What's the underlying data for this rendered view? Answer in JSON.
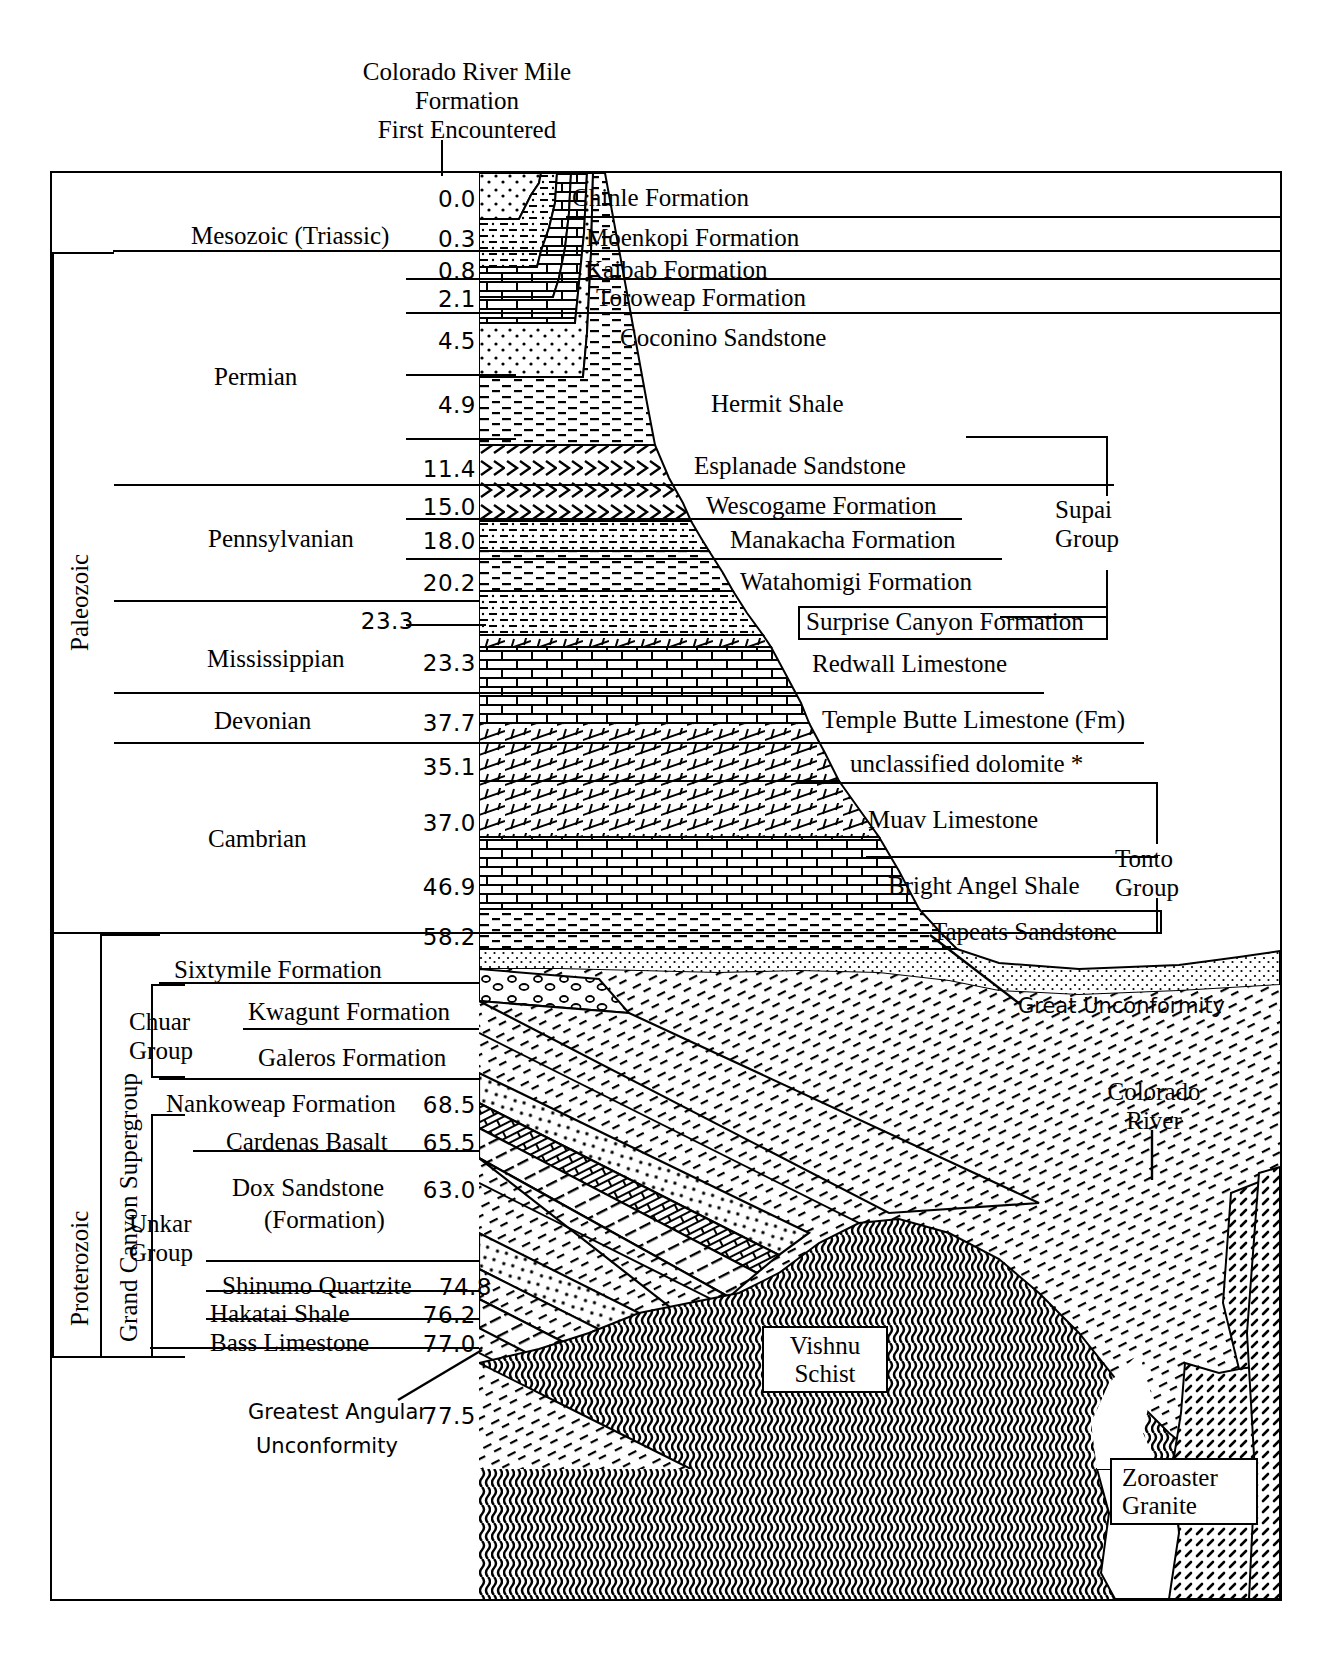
{
  "title": {
    "line1": "Colorado River Mile",
    "line2": "Formation",
    "line3": "First Encountered"
  },
  "eras": [
    {
      "name": "Mesozoic",
      "qualifier": "(Triassic)"
    },
    {
      "name": "Paleozoic",
      "qualifier": ""
    },
    {
      "name": "Proterozoic",
      "qualifier": ""
    }
  ],
  "periods": [
    {
      "label": "Mesozoic   (Triassic)"
    },
    {
      "label": "Permian"
    },
    {
      "label": "Pennsylvanian"
    },
    {
      "label": "Mississippian"
    },
    {
      "label": "Devonian"
    },
    {
      "label": "Cambrian"
    }
  ],
  "era_vertical_labels": [
    {
      "label": "Paleozoic"
    },
    {
      "label": "Proterozoic"
    },
    {
      "label": "Grand Canyon Supergroup"
    }
  ],
  "groups": [
    {
      "label_line1": "Supai",
      "label_line2": "Group"
    },
    {
      "label_line1": "Tonto",
      "label_line2": "Group"
    },
    {
      "label_line1": "Chuar",
      "label_line2": "Group"
    },
    {
      "label_line1": "Unkar",
      "label_line2": "Group"
    }
  ],
  "formations": [
    {
      "mile": "0.0",
      "name": "Chinle  Formation"
    },
    {
      "mile": "0.3",
      "name": "Moenkopi Formation"
    },
    {
      "mile": "0.8",
      "name": "Kaibab Formation"
    },
    {
      "mile": "2.1",
      "name": "Toroweap Formation"
    },
    {
      "mile": "4.5",
      "name": "Coconino Sandstone"
    },
    {
      "mile": "4.9",
      "name": "Hermit Shale"
    },
    {
      "mile": "11.4",
      "name": "Esplanade Sandstone"
    },
    {
      "mile": "15.0",
      "name": "Wescogame Formation"
    },
    {
      "mile": "18.0",
      "name": "Manakacha Formation"
    },
    {
      "mile": "20.2",
      "name": "Watahomigi Formation"
    },
    {
      "mile": "23.3",
      "name": "Surprise Canyon Formation"
    },
    {
      "mile": "23.3",
      "name": "Redwall Limestone"
    },
    {
      "mile": "37.7",
      "name": "Temple Butte Limestone  (Fm)"
    },
    {
      "mile": "35.1",
      "name": "unclassified  dolomite *"
    },
    {
      "mile": "37.0",
      "name": "Muav Limestone"
    },
    {
      "mile": "46.9",
      "name": "Bright Angel Shale"
    },
    {
      "mile": "58.2",
      "name": "Tapeats Sandstone"
    },
    {
      "mile": "",
      "name": "Sixtymile Formation"
    },
    {
      "mile": "",
      "name": "Kwagunt Formation"
    },
    {
      "mile": "",
      "name": "Galeros Formation"
    },
    {
      "mile": "68.5",
      "name": "Nankoweap Formation"
    },
    {
      "mile": "65.5",
      "name": "Cardenas Basalt"
    },
    {
      "mile": "63.0",
      "name": "Dox Sandstone",
      "name2": "(Formation)"
    },
    {
      "mile": "74.8",
      "name": "Shinumo  Quartzite"
    },
    {
      "mile": "76.2",
      "name": "Hakatai Shale"
    },
    {
      "mile": "77.0",
      "name": "Bass Limestone"
    }
  ],
  "annotations": {
    "great_unconformity": "Great Unconformity",
    "greatest_angular_line1": "Greatest Angular",
    "greatest_angular_line2": "Unconformity",
    "greatest_angular_mile": "77.5",
    "colorado_river_line1": "Colorado",
    "colorado_river_line2": "River"
  },
  "basement": {
    "vishnu_line1": "Vishnu",
    "vishnu_line2": "Schist",
    "zoroaster_line1": "Zoroaster",
    "zoroaster_line2": "Granite"
  },
  "colors": {
    "ink": "#000000",
    "paper": "#ffffff"
  }
}
